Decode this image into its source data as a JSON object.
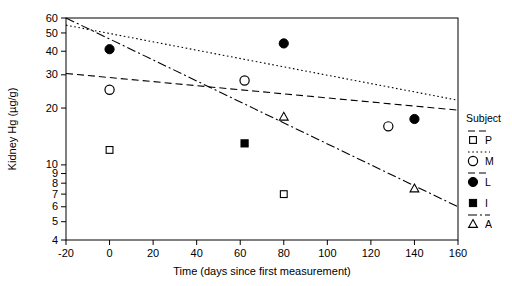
{
  "chart_data": {
    "type": "scatter",
    "title": "",
    "xlabel": "Time (days since first measurement)",
    "ylabel": "Kidney Hg (µg/g)",
    "xlim": [
      -20,
      160
    ],
    "ylim": [
      4,
      60
    ],
    "yscale": "log",
    "xscale": "linear",
    "grid": false,
    "legend_position": "right",
    "legend_title": "Subject",
    "xticks": [
      -20,
      0,
      20,
      40,
      60,
      80,
      100,
      120,
      140,
      160
    ],
    "xtick_labels": [
      "-20",
      "0",
      "20",
      "40",
      "60",
      "80",
      "100",
      "120",
      "140",
      "160"
    ],
    "yticks": [
      4,
      5,
      6,
      7,
      8,
      9,
      10,
      20,
      30,
      40,
      50,
      60
    ],
    "ytick_labels": [
      "4",
      "5",
      "6",
      "7",
      "8",
      "9",
      "10",
      "20",
      "30",
      "40",
      "50",
      "60"
    ],
    "series": [
      {
        "name": "P",
        "marker": "open-square",
        "linestyle": "dashed",
        "points": [
          {
            "x": 0,
            "y": 12
          },
          {
            "x": 80,
            "y": 7
          }
        ],
        "fit_line": {
          "x0": -20,
          "y0": 55,
          "x1": 160,
          "y1": 22,
          "style": "dotted"
        }
      },
      {
        "name": "M",
        "marker": "open-circle",
        "linestyle": "dotted",
        "points": [
          {
            "x": 0,
            "y": 25
          },
          {
            "x": 62,
            "y": 28
          },
          {
            "x": 128,
            "y": 16
          }
        ],
        "fit_line": {
          "x0": -20,
          "y0": 30.5,
          "x1": 160,
          "y1": 19.5,
          "style": "dashed"
        }
      },
      {
        "name": "L",
        "marker": "filled-circle",
        "linestyle": "dashed",
        "points": [
          {
            "x": 0,
            "y": 41
          },
          {
            "x": 80,
            "y": 44
          },
          {
            "x": 140,
            "y": 17.5
          }
        ],
        "fit_line": null
      },
      {
        "name": "I",
        "marker": "filled-square",
        "linestyle": "solid",
        "points": [
          {
            "x": 62,
            "y": 13
          }
        ],
        "fit_line": null
      },
      {
        "name": "A",
        "marker": "open-triangle",
        "linestyle": "dash-dot",
        "points": [
          {
            "x": 80,
            "y": 18
          },
          {
            "x": 140,
            "y": 7.5
          }
        ],
        "fit_line": {
          "x0": -20,
          "y0": 60,
          "x1": 160,
          "y1": 6,
          "style": "dash-dot"
        }
      }
    ]
  },
  "legend": {
    "title": "Subject",
    "entries": [
      {
        "label": "P",
        "marker": "open-square",
        "linestyle": "dashed"
      },
      {
        "label": "M",
        "marker": "open-circle",
        "linestyle": "dotted"
      },
      {
        "label": "L",
        "marker": "filled-circle",
        "linestyle": "dashed"
      },
      {
        "label": "I",
        "marker": "filled-square",
        "linestyle": "none"
      },
      {
        "label": "A",
        "marker": "open-triangle",
        "linestyle": "dash-dot"
      }
    ]
  }
}
